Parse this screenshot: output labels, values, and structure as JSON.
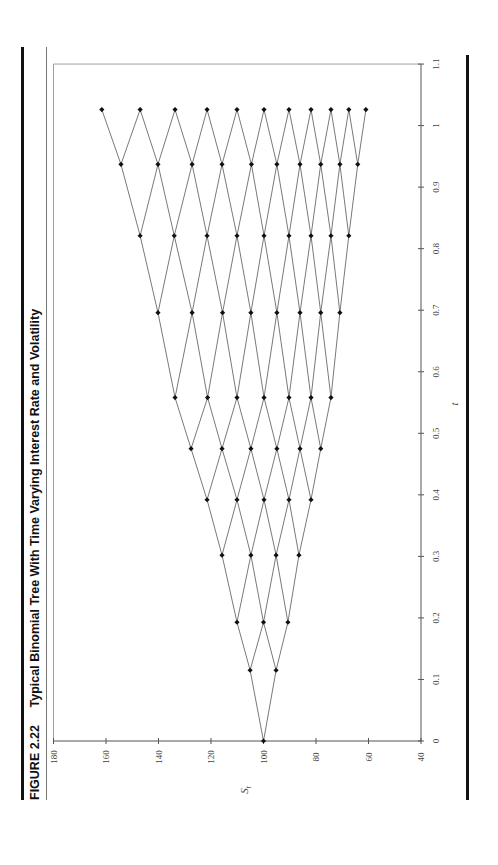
{
  "figure": {
    "number": "FIGURE 2.22",
    "caption": "Typical Binomial Tree With Time Varying Interest Rate and Volatility"
  },
  "colors": {
    "rule": "#111111",
    "axis": "#555555",
    "edge": "#6a6a6a",
    "node": "#111111",
    "text": "#444444"
  },
  "chart_data": {
    "type": "scatter",
    "subtype": "binomial-tree",
    "title": "Typical Binomial Tree With Time Varying Interest Rate and Volatility",
    "xlabel": "t",
    "ylabel": "S_t",
    "xlim": [
      0,
      1.1
    ],
    "ylim": [
      40,
      180
    ],
    "x_ticks": [
      "0",
      "0.1",
      "0.2",
      "0.3",
      "0.4",
      "0.5",
      "0.6",
      "0.7",
      "0.8",
      "0.9",
      "1",
      "1.1"
    ],
    "y_ticks": [
      "40",
      "60",
      "80",
      "100",
      "120",
      "140",
      "160",
      "180"
    ],
    "grid": false,
    "legend": null,
    "orientation_note": "page rotated 90 degrees counter-clockwise",
    "steps": [
      {
        "t": 0.0,
        "S": [
          100.0
        ]
      },
      {
        "t": 0.115,
        "S": [
          105.1,
          95.2
        ]
      },
      {
        "t": 0.193,
        "S": [
          110.1,
          100.0,
          90.7
        ]
      },
      {
        "t": 0.302,
        "S": [
          115.8,
          104.8,
          95.2,
          86.5
        ]
      },
      {
        "t": 0.392,
        "S": [
          121.5,
          110.1,
          99.8,
          90.3,
          81.9
        ]
      },
      {
        "t": 0.475,
        "S": [
          127.6,
          115.8,
          104.8,
          94.9,
          86.1,
          78.2
        ]
      },
      {
        "t": 0.558,
        "S": [
          133.7,
          121.3,
          110.1,
          99.8,
          90.3,
          81.9,
          74.3
        ]
      },
      {
        "t": 0.696,
        "S": [
          140.2,
          127.2,
          115.6,
          104.8,
          94.9,
          86.1,
          78.2,
          70.9
        ]
      },
      {
        "t": 0.821,
        "S": [
          147.0,
          134.0,
          121.5,
          110.1,
          99.8,
          90.3,
          81.9,
          74.3,
          67.5
        ]
      },
      {
        "t": 0.937,
        "S": [
          154.3,
          140.2,
          127.2,
          115.8,
          104.6,
          94.9,
          86.1,
          78.2,
          70.9,
          64.1
        ]
      },
      {
        "t": 1.026,
        "S": [
          161.6,
          147.0,
          133.7,
          121.5,
          110.1,
          99.8,
          90.3,
          81.9,
          74.3,
          67.5,
          61.0
        ]
      }
    ]
  }
}
